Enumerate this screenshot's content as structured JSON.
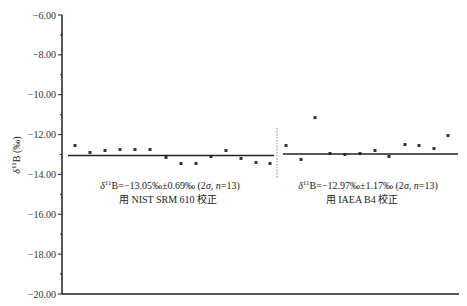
{
  "chart_data": {
    "type": "scatter",
    "title": "",
    "xlabel": "",
    "ylabel": "δ11B (‰)",
    "ylim": [
      -20.0,
      -6.0
    ],
    "yticks": [
      "-6.00",
      "-8.00",
      "-10.00",
      "-12.00",
      "-14.00",
      "-16.00",
      "-18.00",
      "-20.00"
    ],
    "grid": false,
    "legend": null,
    "series": [
      {
        "name": "NIST SRM 610 calibrated",
        "values": [
          -12.55,
          -12.9,
          -12.8,
          -12.75,
          -12.75,
          -12.75,
          -13.15,
          -13.45,
          -13.45,
          -13.1,
          -12.8,
          -13.2,
          -13.4,
          -13.45
        ],
        "mean": -13.05,
        "annotation_line1": "δ11B=−13.05‰±0.69‰ (2σ, n=13)",
        "annotation_line2": "用 NIST SRM 610 校正"
      },
      {
        "name": "IAEA B4 calibrated",
        "values": [
          -12.55,
          -13.25,
          -11.15,
          -12.95,
          -13.0,
          -12.95,
          -12.8,
          -13.1,
          -12.5,
          -12.55,
          -12.7,
          -12.05
        ],
        "mean": -12.97,
        "annotation_line1": "δ11B=−12.97‰±1.17‰ (2σ, n=13)",
        "annotation_line2": "用 IAEA B4 校正"
      }
    ],
    "separator": "dotted vertical line between groups"
  },
  "labels": {
    "y_axis": "δ11B (‰)",
    "left_annot_1": "δ11B=−13.05‰±0.69‰ (2σ, n=13)",
    "left_annot_2": "用 NIST SRM 610 校正",
    "right_annot_1": "δ11B=−12.97‰±1.17‰ (2σ, n=13)",
    "right_annot_2": "用 IAEA B4 校正"
  }
}
